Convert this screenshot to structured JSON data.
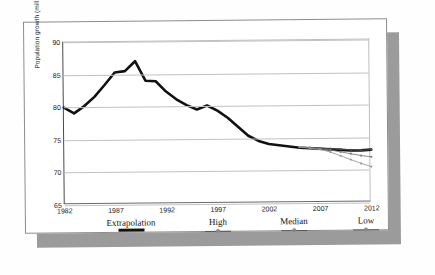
{
  "chart_data": {
    "type": "line",
    "title": "",
    "xlabel": "",
    "ylabel": "Population growth (millions)",
    "xlim": [
      1982,
      2012
    ],
    "ylim": [
      65,
      90
    ],
    "ytick_labels": [
      "65",
      "70",
      "75",
      "80",
      "85",
      "90"
    ],
    "ytick_values": [
      65,
      70,
      75,
      80,
      85,
      90
    ],
    "xtick_labels": [
      "1982",
      "1987",
      "1992",
      "1997",
      "2002",
      "2007",
      "2012"
    ],
    "xtick_values": [
      1982,
      1987,
      1992,
      1997,
      2002,
      2007,
      2012
    ],
    "grid": "horizontal",
    "legend_position": "below-axes",
    "series": [
      {
        "name": "Extrapolation",
        "style": "thick-solid-black",
        "color": "#111111",
        "x": [
          1982,
          1983,
          1984,
          1985,
          1986,
          1987,
          1988,
          1989,
          1990,
          1991,
          1992,
          1993,
          1994,
          1995,
          1996,
          1997,
          1998,
          1999,
          2000,
          2001,
          2002,
          2003,
          2004,
          2005,
          2006,
          2007,
          2008,
          2009,
          2010,
          2011,
          2012
        ],
        "values": [
          80.0,
          79.1,
          80.2,
          81.6,
          83.4,
          85.3,
          85.5,
          87.0,
          84.0,
          83.9,
          82.3,
          81.1,
          80.2,
          79.5,
          80.1,
          79.3,
          78.2,
          76.8,
          75.4,
          74.6,
          74.1,
          73.9,
          73.7,
          73.5,
          73.4,
          73.3,
          73.2,
          73.1,
          73.0,
          73.0,
          73.1
        ]
      },
      {
        "name": "High",
        "style": "thin-line-marker",
        "color": "#4d4d4d",
        "x": [
          2005,
          2006,
          2007,
          2008,
          2009,
          2010,
          2011,
          2012
        ],
        "values": [
          73.6,
          73.5,
          73.4,
          73.3,
          73.2,
          73.1,
          73.0,
          73.1
        ]
      },
      {
        "name": "Median",
        "style": "thin-line-marker",
        "color": "#7a7a7a",
        "x": [
          2005,
          2006,
          2007,
          2008,
          2009,
          2010,
          2011,
          2012
        ],
        "values": [
          73.6,
          73.5,
          73.3,
          73.1,
          72.8,
          72.5,
          72.2,
          72.0
        ]
      },
      {
        "name": "Low",
        "style": "thin-line-marker",
        "color": "#9a9a9a",
        "x": [
          2005,
          2006,
          2007,
          2008,
          2009,
          2010,
          2011,
          2012
        ],
        "values": [
          73.6,
          73.4,
          73.2,
          72.8,
          72.2,
          71.6,
          71.0,
          70.5
        ]
      }
    ]
  },
  "legend": {
    "items": [
      {
        "label": "Extrapolation",
        "swatch": "thick-line-swatch"
      },
      {
        "label": "High",
        "swatch": "thin-line-marker-swatch"
      },
      {
        "label": "Median",
        "swatch": "thin-line-marker-swatch"
      },
      {
        "label": "Low",
        "swatch": "thin-line-marker-swatch"
      }
    ]
  },
  "colors": {
    "paper": "#ffffff",
    "shadow": "#9b9b9b",
    "grid": "#c2c2c2",
    "axis": "#4a4a4a",
    "extrapolation": "#111111"
  }
}
